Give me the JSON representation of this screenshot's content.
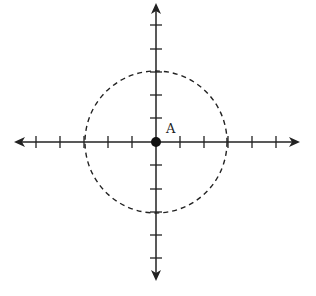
{
  "diagram": {
    "type": "coordinate-axes-with-circle",
    "point_label": "A",
    "center": [
      156,
      142
    ],
    "axis_color": "#222222",
    "circle": {
      "radius": 71,
      "style": "dashed",
      "dash": "5 4"
    },
    "x_ticks": [
      36,
      60,
      84,
      108,
      132,
      180,
      204,
      228,
      252,
      276
    ],
    "y_ticks": [
      25,
      49,
      72,
      95,
      118,
      165,
      189,
      212,
      235,
      258
    ],
    "x_axis": {
      "from": 14,
      "to": 300
    },
    "y_axis": {
      "from": 3,
      "to": 281
    }
  }
}
